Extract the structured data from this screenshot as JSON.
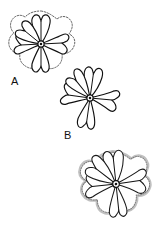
{
  "figure": {
    "background_color": "#ffffff",
    "ink_color": "#111111",
    "halo_color": "#8c8c8c",
    "width": 156,
    "height": 227,
    "style": "black-and-white botanical line drawing"
  },
  "labels": [
    {
      "id": "label-a",
      "text": "A",
      "x": 11,
      "y": 85
    },
    {
      "id": "label-b",
      "text": "B",
      "x": 64,
      "y": 139
    }
  ],
  "flowers": [
    {
      "id": "flower-a",
      "label": "A",
      "cx": 41,
      "cy": 44,
      "radius": 30,
      "petal_count": 5,
      "rotation_deg": 0,
      "outline_style": "dotted-contour",
      "notes": "five petals with notched heart-shaped tips, dotted outer contour"
    },
    {
      "id": "flower-b",
      "label": "B",
      "cx": 90,
      "cy": 98,
      "radius": 29,
      "petal_count": 5,
      "rotation_deg": 8,
      "outline_style": "solid",
      "notes": "five petals with notched tips, clean solid outline"
    },
    {
      "id": "flower-c",
      "label": "",
      "cx": 116,
      "cy": 184,
      "radius": 32,
      "petal_count": 5,
      "rotation_deg": -6,
      "outline_style": "fuzzy-halo",
      "notes": "five petals with notched tips, soft stippled halo outside outline"
    }
  ],
  "center_disc": {
    "ring_radius": 3.1,
    "dot_radius": 1.25
  }
}
